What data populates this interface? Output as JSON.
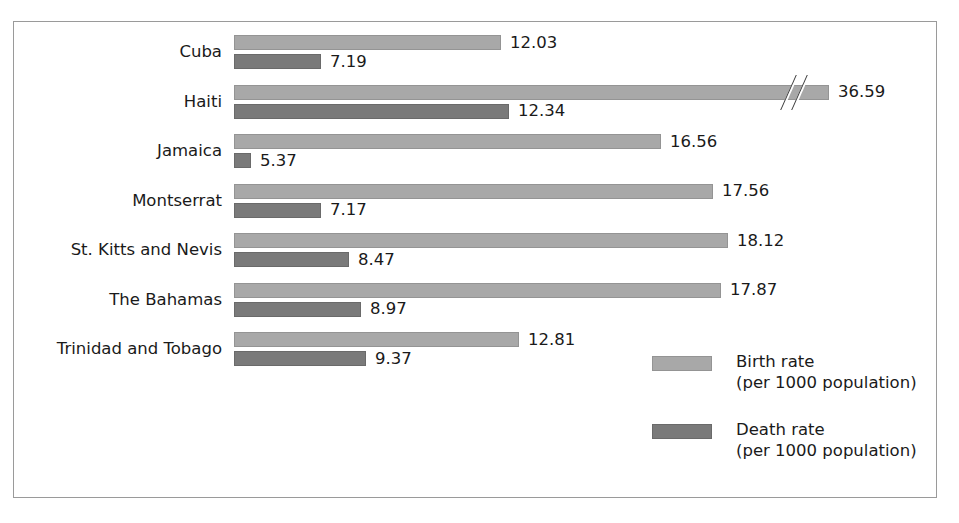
{
  "chart_data": {
    "type": "bar",
    "orientation": "horizontal",
    "title": "",
    "subtitle": "",
    "xlabel": "",
    "ylabel": "",
    "grid": false,
    "legend_position": "bottom-right",
    "axis_break": {
      "present": true,
      "applies_to": {
        "category": "Haiti",
        "series": "Birth rate"
      },
      "marker": "double-slash"
    },
    "categories": [
      "Cuba",
      "Haiti",
      "Jamaica",
      "Montserrat",
      "St. Kitts and Nevis",
      "The Bahamas",
      "Trinidad and Tobago"
    ],
    "series": [
      {
        "name": "Birth rate",
        "unit": "per 1000 population",
        "color": "#a8a8a8",
        "values": [
          12.03,
          36.59,
          16.56,
          17.56,
          18.12,
          17.87,
          12.81
        ],
        "labels": [
          "12.03",
          "36.59",
          "16.56",
          "17.56",
          "18.12",
          "17.87",
          "12.81"
        ],
        "pixel_widths": [
          267,
          595,
          427,
          479,
          494,
          487,
          285
        ]
      },
      {
        "name": "Death rate",
        "unit": "per 1000 population",
        "color": "#7a7a7a",
        "values": [
          7.19,
          12.34,
          5.37,
          7.17,
          8.47,
          8.97,
          9.37
        ],
        "labels": [
          "7.19",
          "12.34",
          "5.37",
          "7.17",
          "8.47",
          "8.97",
          "9.37"
        ],
        "pixel_widths": [
          87,
          275,
          17,
          87,
          115,
          127,
          132
        ]
      }
    ]
  },
  "legend": {
    "entries": [
      {
        "name": "birth-rate",
        "label": "Birth rate",
        "sublabel": "(per 1000 population)",
        "color": "#a8a8a8"
      },
      {
        "name": "death-rate",
        "label": "Death rate",
        "sublabel": "(per 1000 population)",
        "color": "#7a7a7a"
      }
    ]
  },
  "style": {
    "frame_color": "#9a9a9a",
    "background": "#ffffff",
    "text_color": "#1a1a1a"
  }
}
